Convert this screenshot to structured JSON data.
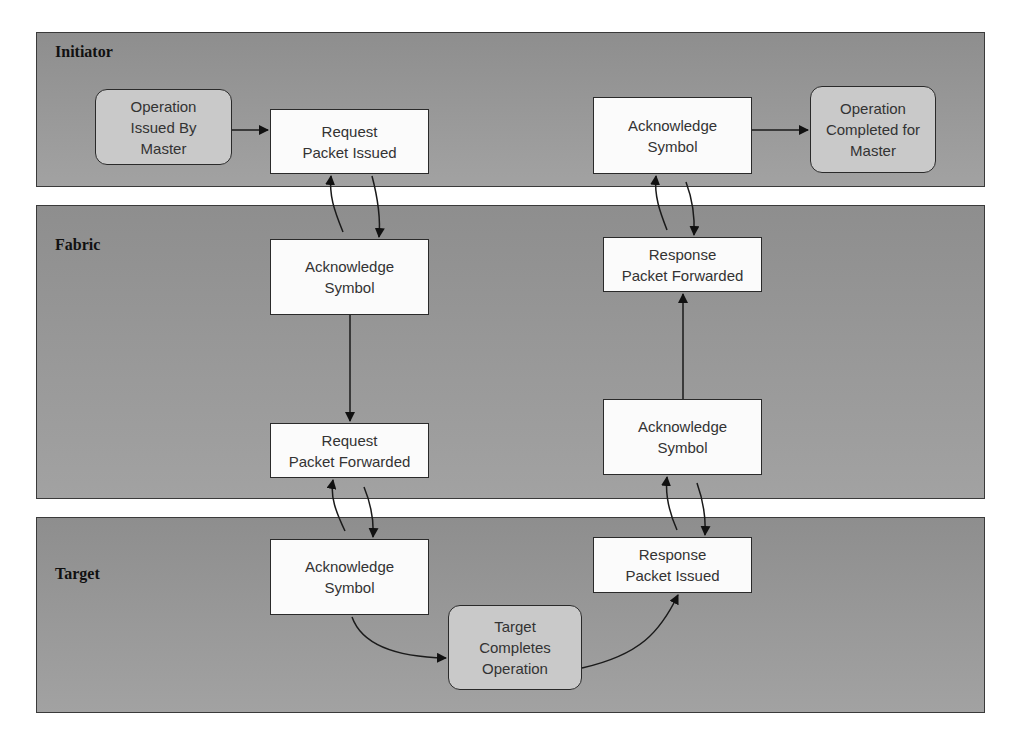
{
  "lanes": [
    {
      "id": "initiator",
      "label": "Initiator"
    },
    {
      "id": "fabric",
      "label": "Fabric"
    },
    {
      "id": "target",
      "label": "Target"
    }
  ],
  "nodes": {
    "op_issued": {
      "lane": "initiator",
      "shape": "rounded",
      "label": "Operation\nIssued By\nMaster"
    },
    "req_issued": {
      "lane": "initiator",
      "shape": "rect",
      "label": "Request\nPacket Issued"
    },
    "ack_init": {
      "lane": "initiator",
      "shape": "rect",
      "label": "Acknowledge\nSymbol"
    },
    "op_completed": {
      "lane": "initiator",
      "shape": "rounded",
      "label": "Operation\nCompleted for\nMaster"
    },
    "ack_fabric_req": {
      "lane": "fabric",
      "shape": "rect",
      "label": "Acknowledge\nSymbol"
    },
    "req_forwarded": {
      "lane": "fabric",
      "shape": "rect",
      "label": "Request\nPacket Forwarded"
    },
    "resp_forwarded": {
      "lane": "fabric",
      "shape": "rect",
      "label": "Response\nPacket Forwarded"
    },
    "ack_fabric_resp": {
      "lane": "fabric",
      "shape": "rect",
      "label": "Acknowledge\nSymbol"
    },
    "ack_target": {
      "lane": "target",
      "shape": "rect",
      "label": "Acknowledge\nSymbol"
    },
    "target_completes": {
      "lane": "target",
      "shape": "rounded",
      "label": "Target\nCompletes\nOperation"
    },
    "resp_issued": {
      "lane": "target",
      "shape": "rect",
      "label": "Response\nPacket Issued"
    }
  },
  "edges": [
    {
      "from": "op_issued",
      "to": "req_issued"
    },
    {
      "from": "req_issued",
      "to": "ack_fabric_req"
    },
    {
      "from": "ack_fabric_req",
      "to": "req_issued"
    },
    {
      "from": "ack_fabric_req",
      "to": "req_forwarded"
    },
    {
      "from": "req_forwarded",
      "to": "ack_target"
    },
    {
      "from": "ack_target",
      "to": "req_forwarded"
    },
    {
      "from": "ack_target",
      "to": "target_completes"
    },
    {
      "from": "target_completes",
      "to": "resp_issued"
    },
    {
      "from": "resp_issued",
      "to": "ack_fabric_resp"
    },
    {
      "from": "ack_fabric_resp",
      "to": "resp_issued"
    },
    {
      "from": "ack_fabric_resp",
      "to": "resp_forwarded"
    },
    {
      "from": "resp_forwarded",
      "to": "ack_init"
    },
    {
      "from": "ack_init",
      "to": "resp_forwarded"
    },
    {
      "from": "ack_init",
      "to": "op_completed"
    }
  ],
  "colors": {
    "lane_fill": "#969696",
    "rect_fill": "#fbfbfb",
    "rounded_fill": "#c9c9c9",
    "stroke": "#222222"
  }
}
